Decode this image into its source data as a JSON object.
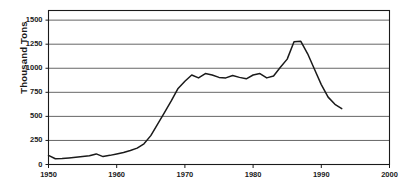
{
  "chart_data": {
    "type": "line",
    "title": "",
    "xlabel": "",
    "ylabel": "Thousand Tons",
    "xlim": [
      1950,
      2000
    ],
    "ylim": [
      0,
      1600
    ],
    "yticks": [
      0,
      250,
      500,
      750,
      1000,
      1250,
      1500
    ],
    "ytick_labels": [
      "0",
      "250",
      "500",
      "750",
      "1000",
      "1250",
      "1500"
    ],
    "xticks": [
      1950,
      1960,
      1970,
      1980,
      1990,
      2000
    ],
    "xtick_labels": [
      "1950",
      "1960",
      "1970",
      "1980",
      "1990",
      "2000"
    ],
    "grid": "horizontal",
    "legend": "none",
    "line_color": "#1a1a1a",
    "grid_color": "#555555",
    "frame_color": "#1a1a1a",
    "series": [
      {
        "name": "Production",
        "x": [
          1950,
          1951,
          1952,
          1953,
          1954,
          1955,
          1956,
          1957,
          1958,
          1959,
          1960,
          1961,
          1962,
          1963,
          1964,
          1965,
          1966,
          1967,
          1968,
          1969,
          1970,
          1971,
          1972,
          1973,
          1974,
          1975,
          1976,
          1977,
          1978,
          1979,
          1980,
          1981,
          1982,
          1983,
          1984,
          1985,
          1986,
          1987,
          1988,
          1989,
          1990,
          1991,
          1992,
          1993
        ],
        "values": [
          95,
          60,
          62,
          68,
          75,
          82,
          90,
          110,
          82,
          95,
          110,
          125,
          145,
          170,
          215,
          300,
          420,
          540,
          660,
          790,
          865,
          930,
          900,
          945,
          930,
          905,
          900,
          925,
          905,
          890,
          930,
          945,
          900,
          920,
          1010,
          1095,
          1275,
          1280,
          1150,
          990,
          830,
          700,
          625,
          580
        ]
      }
    ]
  },
  "axis": {
    "ylabel": "Thousand Tons"
  }
}
